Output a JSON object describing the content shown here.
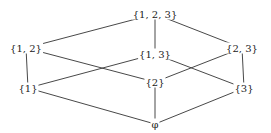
{
  "diagram": {
    "type": "hasse-diagram",
    "nodes": [
      {
        "id": "n123",
        "label": "{1, 2, 3}",
        "x": 155,
        "y": 14
      },
      {
        "id": "n12",
        "label": "{1, 2}",
        "x": 26,
        "y": 48
      },
      {
        "id": "n13",
        "label": "{1, 3}",
        "x": 155,
        "y": 54
      },
      {
        "id": "n23",
        "label": "{2, 3}",
        "x": 242,
        "y": 48
      },
      {
        "id": "n1",
        "label": "{1}",
        "x": 28,
        "y": 88
      },
      {
        "id": "n2",
        "label": "{2}",
        "x": 155,
        "y": 82
      },
      {
        "id": "n3",
        "label": "{3}",
        "x": 244,
        "y": 88
      },
      {
        "id": "n0",
        "label": "φ",
        "x": 155,
        "y": 124
      }
    ],
    "edges": [
      [
        "n123",
        "n12"
      ],
      [
        "n123",
        "n13"
      ],
      [
        "n123",
        "n23"
      ],
      [
        "n12",
        "n1"
      ],
      [
        "n12",
        "n2"
      ],
      [
        "n13",
        "n1"
      ],
      [
        "n13",
        "n3"
      ],
      [
        "n23",
        "n2"
      ],
      [
        "n23",
        "n3"
      ],
      [
        "n1",
        "n0"
      ],
      [
        "n2",
        "n0"
      ],
      [
        "n3",
        "n0"
      ]
    ]
  }
}
